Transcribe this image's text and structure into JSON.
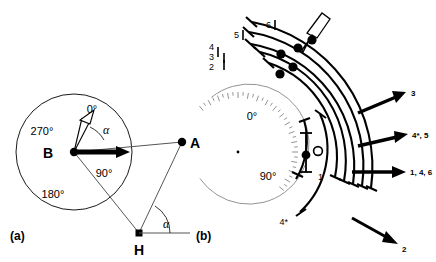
{
  "figure": {
    "panels": [
      {
        "id": "a",
        "label": "(a)",
        "points": [
          {
            "name": "B",
            "label": "B"
          },
          {
            "name": "A",
            "label": "A"
          },
          {
            "name": "H",
            "label": "H"
          }
        ],
        "compass_labels": [
          "0°",
          "90°",
          "180°",
          "270°"
        ],
        "angle_labels": [
          "α",
          "α"
        ]
      },
      {
        "id": "b",
        "label": "(b)",
        "dial_labels": [
          "0°",
          "90°"
        ],
        "arc_labels": [
          "1",
          "2",
          "3",
          "4",
          "5",
          "6",
          "4*"
        ],
        "legend": [
          {
            "label": "3"
          },
          {
            "label": "4*, 5"
          },
          {
            "label": "1, 4, 6"
          },
          {
            "label": "2"
          }
        ]
      }
    ]
  },
  "chart_data": {
    "type": "diagram",
    "title": "",
    "panel_a": {
      "description": "Bearing geometry: triangle B-A-H with compass rose centred on B",
      "compass_ticks": [
        {
          "label": "0°",
          "bearing_deg": 0
        },
        {
          "label": "90°",
          "bearing_deg": 90
        },
        {
          "label": "180°",
          "bearing_deg": 180
        },
        {
          "label": "270°",
          "bearing_deg": 270
        }
      ],
      "vectors": [
        {
          "from": "B",
          "style": "hollow-arrow",
          "bearing_deg": 20
        },
        {
          "from": "B",
          "style": "solid-arrow",
          "bearing_deg": 90
        }
      ],
      "angles": [
        {
          "label": "α",
          "at": "B",
          "between": [
            "0° ray",
            "90° ray"
          ]
        },
        {
          "label": "α",
          "at": "H",
          "between": [
            "horizontal",
            "H-A line"
          ]
        }
      ]
    },
    "panel_b": {
      "description": "Polar dial with six concentric measurement arcs, each bearing one data marker",
      "dial_ticks": {
        "from_deg": -40,
        "to_deg": 130,
        "step_deg": 5
      },
      "dial_labels": [
        {
          "label": "0°",
          "bearing_deg": 0
        },
        {
          "label": "90°",
          "bearing_deg": 90
        }
      ],
      "arcs": [
        {
          "label": "1",
          "radius": 74,
          "start_deg": 52,
          "end_deg": 120,
          "marker_deg": 82,
          "marker": "filled"
        },
        {
          "label": "4*",
          "radius": 86,
          "start_deg": 45,
          "end_deg": 134,
          "marker_deg": 78,
          "marker": "open"
        },
        {
          "label": "2",
          "radius": 100,
          "start_deg": -72,
          "end_deg": 36,
          "marker_deg": -26,
          "marker": "filled"
        },
        {
          "label": "3",
          "radius": 112,
          "start_deg": -78,
          "end_deg": 34,
          "marker_deg": -16,
          "marker": "filled"
        },
        {
          "label": "4",
          "radius": 124,
          "start_deg": -82,
          "end_deg": 32,
          "marker_deg": -22,
          "marker": "filled"
        },
        {
          "label": "5",
          "radius": 136,
          "start_deg": -62,
          "end_deg": 30,
          "marker_deg": -14,
          "marker": "filled"
        },
        {
          "label": "6",
          "radius": 148,
          "start_deg": -44,
          "end_deg": 28,
          "marker_deg": -30,
          "marker": "filled"
        }
      ],
      "legend_arrows": [
        {
          "label": "3",
          "direction_deg": -28
        },
        {
          "label": "4*, 5",
          "direction_deg": -14
        },
        {
          "label": "1, 4, 6",
          "direction_deg": 0
        },
        {
          "label": "2",
          "direction_deg": 28
        }
      ],
      "outline_arrow": {
        "direction_deg": -55,
        "style": "hollow"
      }
    }
  }
}
